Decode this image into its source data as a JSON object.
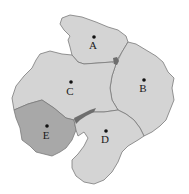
{
  "map": {
    "colors": {
      "background": "#ffffff",
      "region_light": "#d4d4d4",
      "region_E": "#a8a8a8",
      "water": "#6e6e6e",
      "border": "#7a7a7a",
      "marker": "#111111"
    },
    "regions": [
      {
        "id": "A",
        "label": "A"
      },
      {
        "id": "B",
        "label": "B"
      },
      {
        "id": "C",
        "label": "C"
      },
      {
        "id": "D",
        "label": "D"
      },
      {
        "id": "E",
        "label": "E"
      }
    ]
  }
}
